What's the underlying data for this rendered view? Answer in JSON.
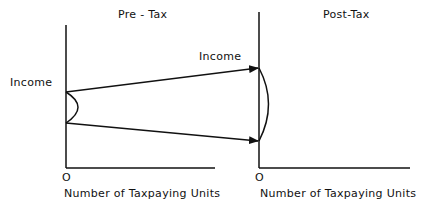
{
  "diagram": {
    "left_panel": {
      "title": "Pre - Tax",
      "y_label": "Income",
      "origin": "O",
      "x_label": "Number of Taxpaying Units"
    },
    "right_panel": {
      "title": "Post-Tax",
      "y_label": "Income",
      "origin": "O",
      "x_label": "Number of Taxpaying Units"
    },
    "colors": {
      "line": "#111111",
      "background": "#ffffff"
    }
  }
}
